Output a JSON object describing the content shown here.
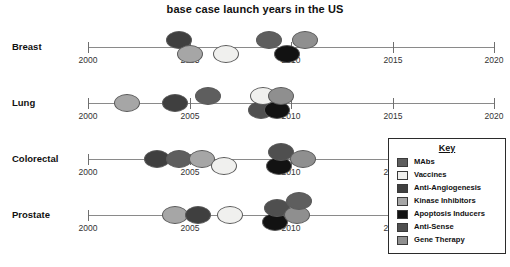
{
  "chart_data": {
    "type": "scatter",
    "title": "base case launch years in the US",
    "xlabel": "",
    "ylabel": "",
    "xlim": [
      2000,
      2020
    ],
    "xticks": [
      2000,
      2005,
      2010,
      2015,
      2020
    ],
    "xticklabels": [
      "2000",
      "2005",
      "2010",
      "2015",
      "2020"
    ],
    "categories": [
      "Breast",
      "Lung",
      "Colorectal",
      "Prostate"
    ],
    "grid": false,
    "legend_position": "right-bottom",
    "legend_title": "Key",
    "legend_entries": [
      {
        "label": "MAbs",
        "color": "#5e5e5e"
      },
      {
        "label": "Vaccines",
        "color": "#f0f0ee"
      },
      {
        "label": "Anti-Angiogenesis",
        "color": "#3f3f3f"
      },
      {
        "label": "Kinase Inhibitors",
        "color": "#a6a6a6"
      },
      {
        "label": "Apoptosis Inducers",
        "color": "#121212"
      },
      {
        "label": "Anti-Sense",
        "color": "#4f4f4f"
      },
      {
        "label": "Gene Therapy",
        "color": "#8f8f8f"
      }
    ],
    "series": [
      {
        "name": "Breast",
        "points": [
          {
            "year": 2004.5,
            "offset": -1,
            "category": "Anti-Angiogenesis"
          },
          {
            "year": 2005.0,
            "offset": 1,
            "category": "Kinase Inhibitors"
          },
          {
            "year": 2006.8,
            "offset": 1,
            "category": "Vaccines"
          },
          {
            "year": 2008.9,
            "offset": -1,
            "category": "MAbs"
          },
          {
            "year": 2009.8,
            "offset": 1,
            "category": "Apoptosis Inducers"
          },
          {
            "year": 2010.7,
            "offset": -1,
            "category": "Gene Therapy"
          }
        ]
      },
      {
        "name": "Lung",
        "points": [
          {
            "year": 2001.9,
            "offset": 0,
            "category": "Kinase Inhibitors"
          },
          {
            "year": 2004.3,
            "offset": 0,
            "category": "Anti-Angiogenesis"
          },
          {
            "year": 2005.9,
            "offset": -1,
            "category": "MAbs"
          },
          {
            "year": 2008.5,
            "offset": 1,
            "category": "Anti-Sense"
          },
          {
            "year": 2009.3,
            "offset": 1,
            "category": "Apoptosis Inducers"
          },
          {
            "year": 2008.6,
            "offset": -1,
            "category": "Vaccines"
          },
          {
            "year": 2009.5,
            "offset": -1,
            "category": "Gene Therapy"
          }
        ]
      },
      {
        "name": "Colorectal",
        "points": [
          {
            "year": 2003.4,
            "offset": 0,
            "category": "Anti-Angiogenesis"
          },
          {
            "year": 2004.5,
            "offset": 0,
            "category": "MAbs"
          },
          {
            "year": 2005.6,
            "offset": 0,
            "category": "Kinase Inhibitors"
          },
          {
            "year": 2006.7,
            "offset": 1,
            "category": "Vaccines"
          },
          {
            "year": 2009.4,
            "offset": 1,
            "category": "Apoptosis Inducers"
          },
          {
            "year": 2009.5,
            "offset": -1,
            "category": "Anti-Sense"
          },
          {
            "year": 2010.6,
            "offset": 0,
            "category": "Gene Therapy"
          }
        ]
      },
      {
        "name": "Prostate",
        "points": [
          {
            "year": 2004.3,
            "offset": 0,
            "category": "Kinase Inhibitors"
          },
          {
            "year": 2005.4,
            "offset": 0,
            "category": "Anti-Angiogenesis"
          },
          {
            "year": 2007.0,
            "offset": 0,
            "category": "Vaccines"
          },
          {
            "year": 2009.2,
            "offset": 1,
            "category": "Apoptosis Inducers"
          },
          {
            "year": 2009.3,
            "offset": -1,
            "category": "Anti-Sense"
          },
          {
            "year": 2010.3,
            "offset": 0,
            "category": "Gene Therapy"
          },
          {
            "year": 2010.4,
            "offset": -2,
            "category": "MAbs"
          }
        ]
      }
    ]
  }
}
